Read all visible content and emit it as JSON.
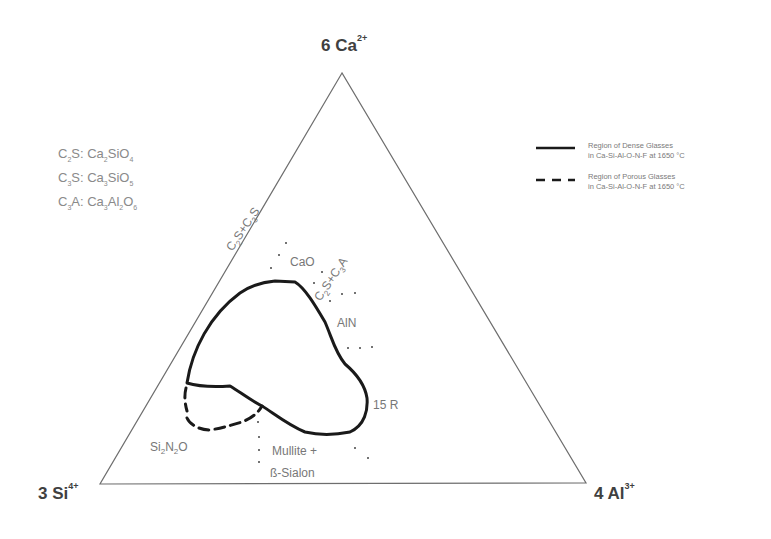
{
  "diagram": {
    "vertices": {
      "top": {
        "coef": "6",
        "element": "Ca",
        "charge": "2+"
      },
      "left": {
        "coef": "3",
        "element": "Si",
        "charge": "4+"
      },
      "right": {
        "coef": "4",
        "element": "Al",
        "charge": "3+"
      }
    },
    "abbreviations": [
      {
        "abbr": "C",
        "abbr_sub": "2",
        "abbr_tail": "S:",
        "formula_parts": [
          "Ca",
          "2",
          "SiO",
          "4"
        ]
      },
      {
        "abbr": "C",
        "abbr_sub": "3",
        "abbr_tail": "S:",
        "formula_parts": [
          "Ca",
          "3",
          "SiO",
          "5"
        ]
      },
      {
        "abbr": "C",
        "abbr_sub": "3",
        "abbr_tail": "A:",
        "formula_parts": [
          "Ca",
          "3",
          "Al",
          "2",
          "O",
          "6"
        ]
      }
    ],
    "legend": [
      {
        "style": "solid",
        "line1": "Region of Dense Glasses",
        "line2": "in Ca-Si-Al-O-N-F at 1650 °C"
      },
      {
        "style": "dashed",
        "line1": "Region of Porous Glasses",
        "line2": "in Ca-Si-Al-O-N-F at 1650 °C"
      }
    ],
    "phase_labels": {
      "c2s_c3s": "C2S+C3S",
      "cao": "CaO",
      "c2s_c3a": "C2S+C3A",
      "aln": "AlN",
      "r15": "15 R",
      "si2n2o": [
        "Si",
        "2",
        "N",
        "2",
        "O"
      ],
      "mullite_line1": "Mullite +",
      "mullite_line2": "ß-Sialon"
    },
    "colors": {
      "triangle": "#6e6e6e",
      "region_line": "#1a1a1a",
      "label_text": "#7a7a7a",
      "vertex_text": "#404040"
    }
  },
  "chart_data": {
    "type": "ternary-region",
    "title": "",
    "axes": [
      "6 Ca2+",
      "3 Si4+",
      "4 Al3+"
    ],
    "series": [
      {
        "name": "Region of Dense Glasses in Ca-Si-Al-O-N-F at 1650 °C",
        "style": "solid"
      },
      {
        "name": "Region of Porous Glasses in Ca-Si-Al-O-N-F at 1650 °C",
        "style": "dashed"
      }
    ],
    "phase_fields": [
      "C2S+C3S",
      "CaO",
      "C2S+C3A",
      "AlN",
      "15 R",
      "Si2N2O",
      "Mullite + ß-Sialon"
    ],
    "legend_position": "upper-right"
  }
}
